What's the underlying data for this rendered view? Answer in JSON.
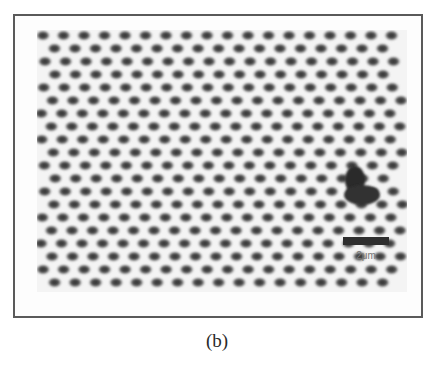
{
  "figure": {
    "caption": "(b)",
    "scale_bar": {
      "label": "2μm"
    },
    "colors": {
      "frame": "#5a5a5a",
      "dot": "#3a3a3a",
      "background": "#fdfdfd"
    },
    "grid": {
      "dx": 20.5,
      "dy": 13,
      "cols": 19,
      "rows": 20
    },
    "defect": {
      "x": 312,
      "y": 140,
      "w": 30,
      "h": 32
    }
  }
}
